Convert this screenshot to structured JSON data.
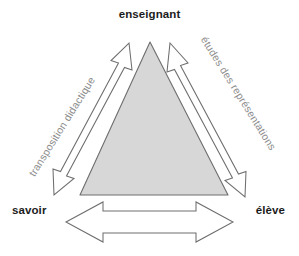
{
  "diagram": {
    "title_text": "Triangle didactique",
    "background_color": "#ffffff",
    "triangle": {
      "fill_color": "#d7d7d7",
      "stroke_color": "#6e6e6e",
      "apex": [
        150,
        42
      ],
      "base_left": [
        80,
        195
      ],
      "base_right": [
        228,
        195
      ]
    },
    "vertices": [
      {
        "id": "enseignant",
        "label": "enseignant",
        "position": "top",
        "color": "#1c1c1c"
      },
      {
        "id": "savoir",
        "label": "savoir",
        "position": "bottom-left",
        "color": "#1c1c1c"
      },
      {
        "id": "eleve",
        "label": "élève",
        "position": "bottom-right",
        "color": "#1c1c1c"
      }
    ],
    "edges": [
      {
        "id": "transposition-didactique",
        "label": "transposition didactique",
        "from": "savoir",
        "to": "enseignant",
        "arrow": "double-headed",
        "orientation": "diagonal-left",
        "rotation_deg": -58,
        "label_color": "#8c8c8c",
        "arrow_fill": "#ffffff",
        "arrow_stroke": "#6e6e6e"
      },
      {
        "id": "etudes-des-representations",
        "label": "études des représentations",
        "from": "enseignant",
        "to": "eleve",
        "arrow": "double-headed",
        "orientation": "diagonal-right",
        "rotation_deg": 58,
        "label_color": "#8c8c8c",
        "arrow_fill": "#ffffff",
        "arrow_stroke": "#6e6e6e"
      },
      {
        "id": "savoir-eleve",
        "label": "",
        "from": "savoir",
        "to": "eleve",
        "arrow": "double-headed",
        "orientation": "horizontal",
        "rotation_deg": 0,
        "label_color": "#8c8c8c",
        "arrow_fill": "#ffffff",
        "arrow_stroke": "#6e6e6e"
      }
    ]
  }
}
